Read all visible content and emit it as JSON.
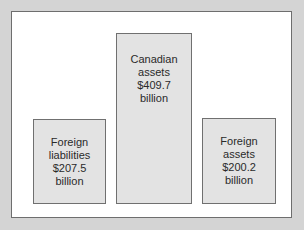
{
  "diagram": {
    "boxes": [
      {
        "id": "foreign-liabilities",
        "lines": [
          "Foreign",
          "liabilities",
          "$207.5",
          "billion"
        ]
      },
      {
        "id": "canadian-assets",
        "lines": [
          "Canadian",
          "assets",
          "$409.7",
          "billion"
        ]
      },
      {
        "id": "foreign-assets",
        "lines": [
          "Foreign",
          "assets",
          "$200.2",
          "billion"
        ]
      }
    ]
  },
  "chart_data": {
    "type": "bar",
    "categories": [
      "Foreign liabilities",
      "Canadian assets",
      "Foreign assets"
    ],
    "values": [
      207.5,
      409.7,
      200.2
    ],
    "title": "",
    "xlabel": "",
    "ylabel": "$ billion",
    "grid": false
  }
}
